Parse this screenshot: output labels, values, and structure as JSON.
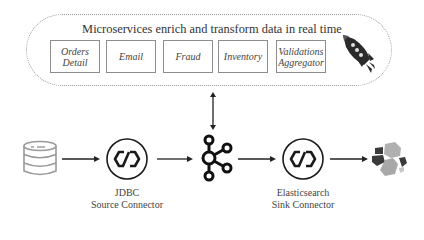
{
  "diagram": {
    "title": "Microservices enrich and transform data in real time",
    "microservices": [
      {
        "label": "Orders\nDetail"
      },
      {
        "label": "Email"
      },
      {
        "label": "Fraud"
      },
      {
        "label": "Inventory"
      },
      {
        "label": "Validations\nAggregator"
      }
    ],
    "pipeline": [
      {
        "id": "database",
        "icon": "database-icon"
      },
      {
        "id": "jdbc-source-connector",
        "icon": "connector-icon",
        "label": "JDBC\nSource Connector"
      },
      {
        "id": "kafka",
        "icon": "kafka-icon"
      },
      {
        "id": "elasticsearch-sink-connector",
        "icon": "connector-icon",
        "label": "Elasticsearch\nSink Connector"
      },
      {
        "id": "elasticsearch",
        "icon": "elasticsearch-icon"
      }
    ],
    "colors": {
      "line": "#222222",
      "box_border": "#8d8d8d",
      "dotted_border": "#9a9a9a",
      "icon_dark": "#1a1a1a",
      "icon_grey": "#a8a8a8",
      "icon_dark_grey": "#3a3a3a"
    }
  }
}
